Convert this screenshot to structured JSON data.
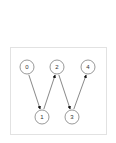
{
  "diagram": {
    "type": "directed-graph",
    "colors": {
      "node_stroke": "#555555",
      "node_fill": "#ffffff",
      "edge": "#555555",
      "arrowhead": "#111111",
      "highlight_crescent": "#111111",
      "frame_border": "#e2e2e2"
    },
    "nodes": [
      {
        "id": "0",
        "label": "0",
        "cx": 27,
        "cy": 67,
        "highlighted": true
      },
      {
        "id": "1",
        "label": "1",
        "cx": 42,
        "cy": 117,
        "highlighted": false
      },
      {
        "id": "2",
        "label": "2",
        "cx": 57,
        "cy": 67,
        "highlighted": false
      },
      {
        "id": "3",
        "label": "3",
        "cx": 72,
        "cy": 117,
        "highlighted": false
      },
      {
        "id": "4",
        "label": "4",
        "cx": 88,
        "cy": 67,
        "highlighted": false
      }
    ],
    "edges": [
      {
        "from": "0",
        "to": "1"
      },
      {
        "from": "1",
        "to": "2"
      },
      {
        "from": "2",
        "to": "3"
      },
      {
        "from": "3",
        "to": "4"
      }
    ]
  }
}
